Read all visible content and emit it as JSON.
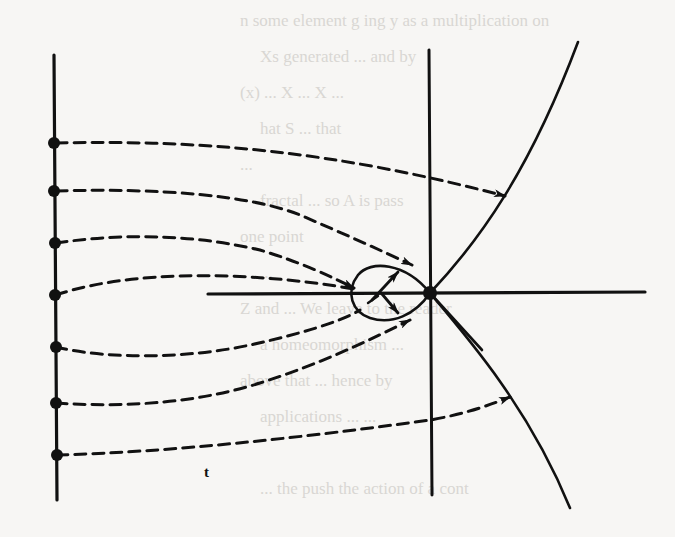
{
  "figure": {
    "label_t": "t",
    "colors": {
      "ink": "#111111",
      "paper": "#f7f6f4",
      "bleed_through": "#d9d7d3"
    },
    "bleed_through_lines": [
      "n some element g ing y as a multiplication on",
      "Xs generated ... and by",
      "(x) ... X ... X ...",
      "hat S ... that",
      "...",
      "fractal ... so A is pass",
      "one point",
      "...",
      "Z and ... We leave to the reader",
      "a homeomorphism ...",
      "above that ... hence by",
      "applications ... ...",
      "",
      "... the push the action of a cont"
    ]
  },
  "geometry": {
    "left_axis": {
      "x": 54,
      "y1": 55,
      "y2": 500
    },
    "center_axis": {
      "x": 430,
      "y1": 50,
      "y2": 495
    },
    "horizontal_axis": {
      "y": 293,
      "x1": 208,
      "x2": 645
    },
    "origin": {
      "x": 430,
      "y": 293
    },
    "initial_points_y": [
      143,
      191,
      243,
      295,
      347,
      403,
      455
    ]
  }
}
